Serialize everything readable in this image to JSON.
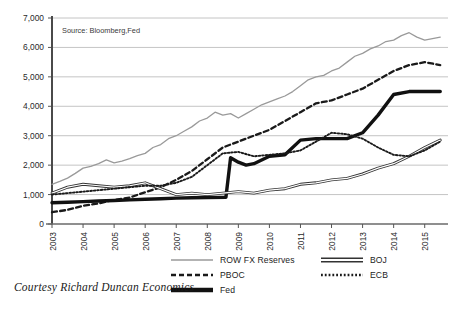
{
  "figure": {
    "source_note": "Source: Bloomberg,Fed",
    "caption": "Courtesy Richard Duncan Economics",
    "top_clipped_title": "",
    "background": "#ffffff",
    "gridline_color": "#b5b5b5",
    "axis_color": "#555555"
  },
  "legend": {
    "left": [
      {
        "label": "ROW FX Reserves",
        "key": "solid-thin-gray",
        "color": "#9a9a9a"
      },
      {
        "label": "PBOC",
        "key": "dashed-thick-black",
        "color": "#1a1a1a"
      },
      {
        "label": "Fed",
        "key": "solid-thick-black",
        "color": "#111111"
      }
    ],
    "right": [
      {
        "label": "BOJ",
        "key": "double-line-hollow",
        "color": "#333333"
      },
      {
        "label": "ECB",
        "key": "dotted-fine-black",
        "color": "#1a1a1a"
      }
    ]
  },
  "chart_data": {
    "type": "line",
    "title": "",
    "subtitle": "",
    "xlabel": "",
    "ylabel": "",
    "xlim": [
      2003,
      2015.75
    ],
    "ylim": [
      0,
      7000
    ],
    "grid": true,
    "legend_position": "bottom",
    "yticks": [
      0,
      1000,
      2000,
      3000,
      4000,
      5000,
      6000,
      7000
    ],
    "ytick_labels": [
      "0",
      "1,000",
      "2,000",
      "3,000",
      "4,000",
      "5,000",
      "6,000",
      "7,000"
    ],
    "xticks": [
      2003,
      2004,
      2005,
      2006,
      2007,
      2008,
      2009,
      2010,
      2011,
      2012,
      2013,
      2014,
      2015
    ],
    "xtick_labels": [
      "2003",
      "2004",
      "2005",
      "2006",
      "2007",
      "2008",
      "2009",
      "2010",
      "2011",
      "2012",
      "2013",
      "2014",
      "2015"
    ],
    "units": "US$ billions",
    "series": [
      {
        "name": "ROW FX Reserves",
        "style": "solid-thin-gray",
        "color": "#9a9a9a",
        "x": [
          2003.0,
          2003.25,
          2003.5,
          2003.75,
          2004.0,
          2004.25,
          2004.5,
          2004.75,
          2005.0,
          2005.25,
          2005.5,
          2005.75,
          2006.0,
          2006.25,
          2006.5,
          2006.75,
          2007.0,
          2007.25,
          2007.5,
          2007.75,
          2008.0,
          2008.25,
          2008.5,
          2008.75,
          2009.0,
          2009.25,
          2009.5,
          2009.75,
          2010.0,
          2010.25,
          2010.5,
          2010.75,
          2011.0,
          2011.25,
          2011.5,
          2011.75,
          2012.0,
          2012.25,
          2012.5,
          2012.75,
          2013.0,
          2013.25,
          2013.5,
          2013.75,
          2014.0,
          2014.25,
          2014.5,
          2014.75,
          2015.0,
          2015.25,
          2015.5
        ],
        "y": [
          1350,
          1450,
          1560,
          1720,
          1900,
          1960,
          2050,
          2180,
          2080,
          2140,
          2220,
          2320,
          2400,
          2600,
          2700,
          2900,
          3000,
          3150,
          3300,
          3500,
          3600,
          3800,
          3700,
          3750,
          3600,
          3750,
          3900,
          4050,
          4150,
          4250,
          4350,
          4500,
          4700,
          4900,
          5000,
          5050,
          5200,
          5300,
          5500,
          5700,
          5800,
          5950,
          6050,
          6200,
          6250,
          6400,
          6500,
          6350,
          6250,
          6300,
          6350
        ]
      },
      {
        "name": "PBOC",
        "style": "dashed-thick-black",
        "color": "#1a1a1a",
        "x": [
          2003.0,
          2003.5,
          2004.0,
          2004.5,
          2005.0,
          2005.5,
          2006.0,
          2006.5,
          2007.0,
          2007.5,
          2008.0,
          2008.5,
          2009.0,
          2009.5,
          2010.0,
          2010.5,
          2011.0,
          2011.5,
          2012.0,
          2012.5,
          2013.0,
          2013.5,
          2014.0,
          2014.5,
          2015.0,
          2015.5
        ],
        "y": [
          400,
          480,
          620,
          700,
          820,
          900,
          1080,
          1250,
          1500,
          1800,
          2200,
          2600,
          2800,
          3000,
          3200,
          3500,
          3800,
          4100,
          4200,
          4400,
          4600,
          4900,
          5200,
          5400,
          5500,
          5400
        ]
      },
      {
        "name": "Fed",
        "style": "solid-thick-black",
        "color": "#111111",
        "x": [
          2003.0,
          2003.5,
          2004.0,
          2004.5,
          2005.0,
          2005.5,
          2006.0,
          2006.5,
          2007.0,
          2007.5,
          2008.0,
          2008.6,
          2008.75,
          2009.0,
          2009.25,
          2009.5,
          2010.0,
          2010.5,
          2011.0,
          2011.5,
          2012.0,
          2012.5,
          2013.0,
          2013.5,
          2014.0,
          2014.5,
          2015.0,
          2015.5
        ],
        "y": [
          720,
          740,
          760,
          780,
          800,
          820,
          840,
          860,
          880,
          890,
          900,
          910,
          2250,
          2100,
          2000,
          2050,
          2300,
          2350,
          2850,
          2900,
          2900,
          2900,
          3100,
          3700,
          4400,
          4500,
          4500,
          4500
        ]
      },
      {
        "name": "BOJ",
        "style": "double-line-hollow",
        "color": "#333333",
        "x": [
          2003.0,
          2003.5,
          2004.0,
          2004.5,
          2005.0,
          2005.5,
          2006.0,
          2006.5,
          2007.0,
          2007.5,
          2008.0,
          2008.5,
          2009.0,
          2009.5,
          2010.0,
          2010.5,
          2011.0,
          2011.5,
          2012.0,
          2012.5,
          2013.0,
          2013.5,
          2014.0,
          2014.5,
          2015.0,
          2015.5
        ],
        "y": [
          1050,
          1250,
          1350,
          1300,
          1250,
          1300,
          1400,
          1200,
          1000,
          1050,
          1000,
          1050,
          1100,
          1050,
          1150,
          1200,
          1350,
          1400,
          1500,
          1550,
          1700,
          1900,
          2050,
          2300,
          2600,
          2850
        ]
      },
      {
        "name": "ECB",
        "style": "dotted-fine-black",
        "color": "#1a1a1a",
        "x": [
          2003.0,
          2003.5,
          2004.0,
          2004.5,
          2005.0,
          2005.5,
          2006.0,
          2006.5,
          2007.0,
          2007.5,
          2008.0,
          2008.5,
          2009.0,
          2009.5,
          2010.0,
          2010.5,
          2011.0,
          2011.5,
          2012.0,
          2012.5,
          2013.0,
          2013.5,
          2014.0,
          2014.5,
          2015.0,
          2015.5
        ],
        "y": [
          1000,
          1050,
          1100,
          1150,
          1200,
          1250,
          1300,
          1300,
          1400,
          1600,
          2000,
          2400,
          2450,
          2300,
          2350,
          2400,
          2500,
          2800,
          3100,
          3050,
          2900,
          2600,
          2350,
          2300,
          2500,
          2800
        ]
      }
    ]
  }
}
